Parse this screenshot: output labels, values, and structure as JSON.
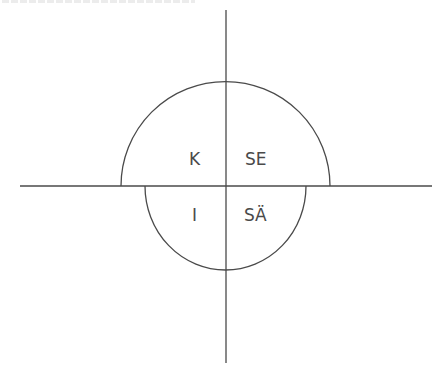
{
  "diagram": {
    "axes": {
      "horizontal": {
        "x1": 20,
        "x2": 432,
        "y": 186
      },
      "vertical": {
        "x": 226,
        "y1": 10,
        "y2": 363
      },
      "color": "#4a4a4a"
    },
    "upper_semicircle": {
      "cx": 225.5,
      "cy": 186,
      "r": 104.5
    },
    "lower_semicircle": {
      "cx": 225.5,
      "cy": 186,
      "r": 82
    },
    "quadrant_labels": {
      "upper_left": "K",
      "upper_right": "SE",
      "lower_left": "I",
      "lower_right": "SÄ"
    }
  }
}
